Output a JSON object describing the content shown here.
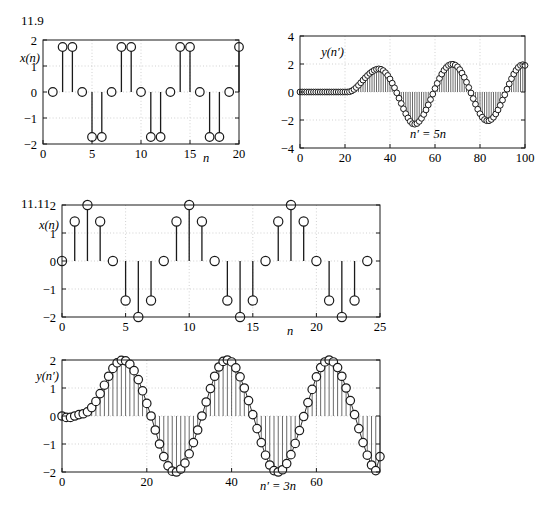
{
  "page": {
    "width": 543,
    "height": 514,
    "background": "#ffffff",
    "ink": "#1a1a1a",
    "grid_color": "#bdbdbd"
  },
  "figures": [
    {
      "id": "fig-11-9-xn",
      "problem_label": "11.9",
      "chart_data": {
        "type": "scatter",
        "title": "",
        "ylabel": "x(n)",
        "xlabel": "n",
        "xlim": [
          0,
          20
        ],
        "ylim": [
          -2,
          2
        ],
        "xticks": [
          0,
          5,
          10,
          15,
          20
        ],
        "xticklabels": [
          "0",
          "5",
          "10",
          "15",
          "20"
        ],
        "yticks": [
          -2,
          -1,
          0,
          1,
          2
        ],
        "yticklabels": [
          "−2",
          "−1",
          "0",
          "1",
          "2"
        ],
        "grid": true,
        "marker": "circle-open",
        "stem": true,
        "x": [
          1,
          2,
          3,
          4,
          5,
          6,
          7,
          8,
          9,
          10,
          11,
          12,
          13,
          14,
          15,
          16,
          17,
          18,
          19,
          20
        ],
        "values": [
          0,
          1.73,
          1.73,
          0,
          -1.73,
          -1.73,
          0,
          1.73,
          1.73,
          0,
          -1.73,
          -1.73,
          0,
          1.73,
          1.73,
          0,
          -1.73,
          -1.73,
          0,
          1.73
        ]
      }
    },
    {
      "id": "fig-11-9-yn",
      "problem_label": "",
      "chart_data": {
        "type": "scatter",
        "title": "",
        "ylabel": "y(n′)",
        "xlabel": "n′ = 5n",
        "xlim": [
          0,
          100
        ],
        "ylim": [
          -4,
          4
        ],
        "xticks": [
          0,
          20,
          40,
          60,
          80,
          100
        ],
        "xticklabels": [
          "0",
          "20",
          "40",
          "60",
          "80",
          "100"
        ],
        "yticks": [
          -4,
          -2,
          0,
          2,
          4
        ],
        "yticklabels": [
          "−4",
          "−2",
          "0",
          "2",
          "4"
        ],
        "grid": true,
        "marker": "circle-open",
        "stem": true,
        "note": "interpolated/upsampled output: zero until n'~22, transient ramp, then steady 2-amplitude oscillation with period ~29",
        "x": [
          0,
          1,
          2,
          3,
          4,
          5,
          6,
          7,
          8,
          9,
          10,
          11,
          12,
          13,
          14,
          15,
          16,
          17,
          18,
          19,
          20,
          21,
          22,
          23,
          24,
          25,
          26,
          27,
          28,
          29,
          30,
          31,
          32,
          33,
          34,
          35,
          36,
          37,
          38,
          39,
          40,
          41,
          42,
          43,
          44,
          45,
          46,
          47,
          48,
          49,
          50,
          51,
          52,
          53,
          54,
          55,
          56,
          57,
          58,
          59,
          60,
          61,
          62,
          63,
          64,
          65,
          66,
          67,
          68,
          69,
          70,
          71,
          72,
          73,
          74,
          75,
          76,
          77,
          78,
          79,
          80,
          81,
          82,
          83,
          84,
          85,
          86,
          87,
          88,
          89,
          90,
          91,
          92,
          93,
          94,
          95,
          96,
          97,
          98,
          99,
          100
        ],
        "values": [
          0,
          0,
          0,
          0,
          0,
          0,
          0,
          0,
          0,
          0,
          0,
          0,
          0,
          0,
          0,
          0,
          0,
          0,
          0,
          0,
          0,
          0,
          0.02,
          0.08,
          0.18,
          0.32,
          0.48,
          0.66,
          0.85,
          1.02,
          1.18,
          1.33,
          1.45,
          1.55,
          1.62,
          1.65,
          1.62,
          1.53,
          1.38,
          1.18,
          0.93,
          0.63,
          0.3,
          -0.06,
          -0.44,
          -0.82,
          -1.2,
          -1.55,
          -1.85,
          -2.1,
          -2.26,
          -2.3,
          -2.25,
          -2.1,
          -1.88,
          -1.6,
          -1.28,
          -0.92,
          -0.54,
          -0.15,
          0.25,
          0.62,
          0.97,
          1.28,
          1.55,
          1.75,
          1.9,
          1.97,
          1.98,
          1.92,
          1.8,
          1.6,
          1.35,
          1.05,
          0.7,
          0.32,
          -0.07,
          -0.47,
          -0.87,
          -1.23,
          -1.55,
          -1.8,
          -1.97,
          -2.05,
          -2.05,
          -1.96,
          -1.8,
          -1.57,
          -1.28,
          -0.95,
          -0.58,
          -0.2,
          0.2,
          0.58,
          0.95,
          1.28,
          1.55,
          1.76,
          1.9,
          1.95,
          1.9,
          0.3
        ]
      }
    },
    {
      "id": "fig-11-11-xn",
      "problem_label": "11.11",
      "chart_data": {
        "type": "scatter",
        "title": "",
        "ylabel": "x(n)",
        "xlabel": "n",
        "xlim": [
          0,
          25
        ],
        "ylim": [
          -2,
          2
        ],
        "xticks": [
          0,
          5,
          10,
          15,
          20,
          25
        ],
        "xticklabels": [
          "0",
          "5",
          "10",
          "15",
          "20",
          "25"
        ],
        "yticks": [
          -2,
          -1,
          0,
          1,
          2
        ],
        "yticklabels": [
          "−2",
          "−1",
          "0",
          "1",
          "2"
        ],
        "grid": true,
        "marker": "circle-open",
        "stem": true,
        "x": [
          0,
          1,
          2,
          3,
          4,
          5,
          6,
          7,
          8,
          9,
          10,
          11,
          12,
          13,
          14,
          15,
          16,
          17,
          18,
          19,
          20,
          21,
          22,
          23,
          24
        ],
        "values": [
          0,
          1.41,
          2,
          1.41,
          0,
          -1.41,
          -2,
          -1.41,
          0,
          1.41,
          2,
          1.41,
          0,
          -1.41,
          -2,
          -1.41,
          0,
          1.41,
          2,
          1.41,
          0,
          -1.41,
          -2,
          -1.41,
          0
        ]
      }
    },
    {
      "id": "fig-11-11-yn",
      "problem_label": "",
      "chart_data": {
        "type": "scatter",
        "title": "",
        "ylabel": "y(n′)",
        "xlabel": "n′ = 3n",
        "xlim": [
          0,
          75
        ],
        "ylim": [
          -2,
          2
        ],
        "xticks": [
          0,
          20,
          40,
          60
        ],
        "xticklabels": [
          "0",
          "20",
          "40",
          "60"
        ],
        "yticks": [
          -2,
          -1,
          0,
          1,
          2
        ],
        "yticklabels": [
          "−2",
          "−1",
          "0",
          "1",
          "2"
        ],
        "grid": true,
        "marker": "circle-open",
        "stem": true,
        "note": "interpolated output: small transient for n'<6 then steady 2-amplitude sine of period 24",
        "x": [
          0,
          1,
          2,
          3,
          4,
          5,
          6,
          7,
          8,
          9,
          10,
          11,
          12,
          13,
          14,
          15,
          16,
          17,
          18,
          19,
          20,
          21,
          22,
          23,
          24,
          25,
          26,
          27,
          28,
          29,
          30,
          31,
          32,
          33,
          34,
          35,
          36,
          37,
          38,
          39,
          40,
          41,
          42,
          43,
          44,
          45,
          46,
          47,
          48,
          49,
          50,
          51,
          52,
          53,
          54,
          55,
          56,
          57,
          58,
          59,
          60,
          61,
          62,
          63,
          64,
          65,
          66,
          67,
          68,
          69,
          70,
          71,
          72,
          73,
          74,
          75
        ],
        "values": [
          0,
          -0.05,
          -0.05,
          0,
          0.05,
          0.08,
          0.15,
          0.3,
          0.52,
          0.8,
          1.1,
          1.42,
          1.7,
          1.9,
          1.99,
          1.97,
          1.85,
          1.62,
          1.3,
          0.9,
          0.45,
          0,
          -0.5,
          -1,
          -1.45,
          -1.78,
          -1.97,
          -2,
          -1.9,
          -1.68,
          -1.35,
          -0.95,
          -0.5,
          0,
          0.5,
          0.98,
          1.42,
          1.75,
          1.95,
          2,
          1.93,
          1.72,
          1.4,
          1,
          0.55,
          0.05,
          -0.45,
          -0.95,
          -1.4,
          -1.75,
          -1.95,
          -2,
          -1.92,
          -1.7,
          -1.38,
          -0.98,
          -0.52,
          -0.02,
          0.48,
          0.95,
          1.4,
          1.73,
          1.93,
          2,
          1.93,
          1.73,
          1.42,
          1,
          0.55,
          0.05,
          -0.45,
          -0.95,
          -1.4,
          -1.75,
          -1.95,
          -1.45
        ]
      }
    }
  ]
}
